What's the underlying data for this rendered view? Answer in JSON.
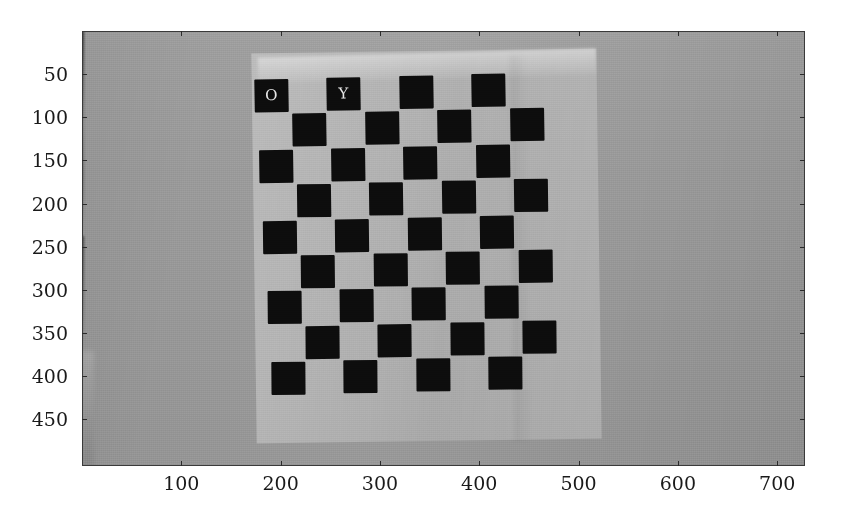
{
  "figure": {
    "type": "image-plot",
    "width": 841,
    "height": 525,
    "background_color": "#ffffff"
  },
  "axes": {
    "x_ticks": [
      100,
      200,
      300,
      400,
      500,
      600,
      700
    ],
    "y_ticks": [
      50,
      100,
      150,
      200,
      250,
      300,
      350,
      400,
      450
    ],
    "x_tick_labels": [
      "100",
      "200",
      "300",
      "400",
      "500",
      "600",
      "700"
    ],
    "y_tick_labels": [
      "50",
      "100",
      "150",
      "200",
      "250",
      "300",
      "350",
      "400",
      "450"
    ],
    "xlim": [
      0,
      728
    ],
    "ylim": [
      504,
      0
    ],
    "xlabel": "",
    "ylabel": "",
    "title": "",
    "tick_direction": "in",
    "ticks_on": [
      "bottom",
      "top",
      "left",
      "right"
    ],
    "grid": false,
    "frame_color": "#3a3a3a",
    "tick_color": "#2b2b2b",
    "label_color": "#1a1a1a"
  },
  "image": {
    "colormap": "gray",
    "wall_color": "#9c9c9c",
    "paper_color": "#c4c4c4",
    "square_color": "#0d0d0d",
    "marker_text_color": "#e8e8e8",
    "corner_markers": [
      {
        "label": "O",
        "meaning": "origin-corner-marker"
      },
      {
        "label": "Y",
        "meaning": "y-axis-direction-marker"
      }
    ],
    "checkerboard": {
      "columns": 8,
      "rows": 9,
      "rotation_deg": -1.4
    },
    "artifacts": [
      "vertical-drip-streak",
      "horizontal-dark-streak",
      "bottom-left-dark-mark",
      "vertical-smudge"
    ]
  },
  "chart_data": {
    "type": "heatmap",
    "title": "",
    "xlabel": "",
    "ylabel": "",
    "xlim": [
      0,
      728
    ],
    "ylim": [
      504,
      0
    ],
    "x_ticks": [
      100,
      200,
      300,
      400,
      500,
      600,
      700
    ],
    "y_ticks": [
      50,
      100,
      150,
      200,
      250,
      300,
      350,
      400,
      450
    ],
    "grid": false,
    "legend": null,
    "colormap": "gray",
    "value_range": [
      0,
      255
    ],
    "regions": [
      {
        "name": "wall-background",
        "value": 155,
        "x_range": [
          0,
          728
        ],
        "y_range": [
          0,
          504
        ]
      },
      {
        "name": "paper-sheet",
        "value": 196,
        "x_range": [
          175,
          525
        ],
        "y_range": [
          20,
          415
        ]
      },
      {
        "name": "checker-dark",
        "value": 13
      },
      {
        "name": "checker-light",
        "value": 192
      }
    ]
  }
}
